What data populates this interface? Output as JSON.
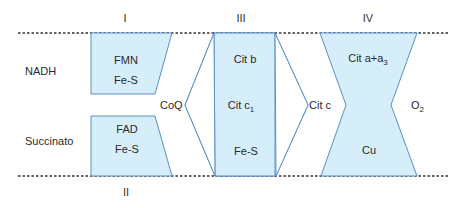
{
  "diagram": {
    "colors": {
      "fill": "#d6eefa",
      "stroke": "#5b8fc4",
      "dashed_line": "#333333",
      "text": "#2a2a2a"
    },
    "complexes": [
      {
        "id": "I",
        "roman": "I",
        "components": [
          "FMN",
          "Fe-S"
        ]
      },
      {
        "id": "II",
        "roman": "II",
        "components": [
          "FAD",
          "Fe-S"
        ]
      },
      {
        "id": "III",
        "roman": "III",
        "components": [
          "Cit b",
          "Cit c",
          "Fe-S"
        ],
        "subscripts": {
          "1": "1"
        }
      },
      {
        "id": "IV",
        "roman": "IV",
        "components": [
          "Cit a+a",
          "Cu"
        ],
        "subscripts": {
          "0": "3"
        }
      }
    ],
    "substrates": {
      "nadh": "NADH",
      "succinato": "Succinato"
    },
    "carriers": {
      "coq": "CoQ",
      "citc": "Cit c",
      "o2": "O",
      "o2_sub": "2"
    }
  }
}
